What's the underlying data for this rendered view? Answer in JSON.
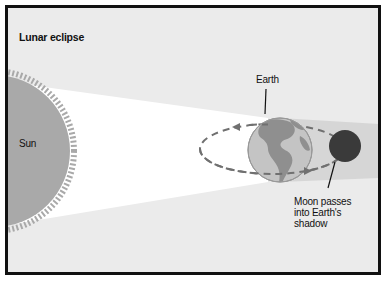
{
  "diagram": {
    "title": "Lunar eclipse",
    "labels": {
      "sun": "Sun",
      "earth": "Earth",
      "moon_caption": "Moon passes into Earth's shadow"
    },
    "colors": {
      "background": "#ebebeb",
      "light_cone": "#ffffff",
      "shadow_cone": "#d4d4d4",
      "sun": "#a9a9a9",
      "earth_ocean": "#bdbdbd",
      "earth_land": "#8e8e8e",
      "moon": "#3a3a3a",
      "orbit": "#707070",
      "border": "#111111"
    }
  }
}
